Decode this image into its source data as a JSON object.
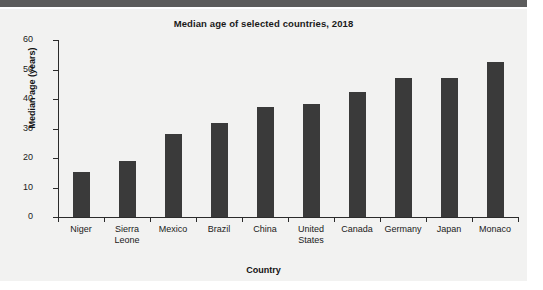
{
  "page": {
    "background_color": "#ffffff",
    "paper_color": "#f2f2f1",
    "header_band_color": "#5c5c5c"
  },
  "chart_data": {
    "type": "bar",
    "title": "Median age of selected countries, 2018",
    "xlabel": "Country",
    "ylabel": "Median age (years)",
    "categories": [
      "Niger",
      "Sierra\nLeone",
      "Mexico",
      "Brazil",
      "China",
      "United\nStates",
      "Canada",
      "Germany",
      "Japan",
      "Monaco"
    ],
    "values": [
      15.2,
      19.1,
      28.3,
      32.0,
      37.4,
      38.3,
      42.4,
      47.0,
      47.0,
      52.6
    ],
    "ylim": [
      0,
      60
    ],
    "yticks": [
      0,
      10,
      20,
      30,
      40,
      50,
      60
    ],
    "ytick_labels": [
      "0",
      "10",
      "20",
      "30",
      "40",
      "50",
      "60"
    ],
    "grid": false,
    "legend": "none",
    "bar_color": "#3a3a3a",
    "axis_color": "#2b2b2b"
  }
}
